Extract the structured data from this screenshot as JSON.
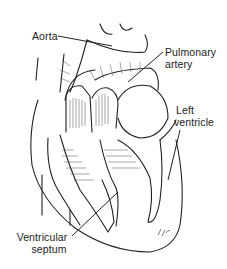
{
  "diagram": {
    "labels": [
      {
        "id": "aorta",
        "text": "Aorta"
      },
      {
        "id": "pulmonary_artery",
        "line1": "Pulmonary",
        "line2": "artery"
      },
      {
        "id": "left_ventricle",
        "line1": "Left",
        "line2": "ventricle"
      },
      {
        "id": "ventricular_septum",
        "line1": "Ventricular",
        "line2": "septum"
      }
    ],
    "signature": "2.4w",
    "colors": {
      "ink": "#222222",
      "background": "#ffffff",
      "shading": "#555555"
    }
  }
}
